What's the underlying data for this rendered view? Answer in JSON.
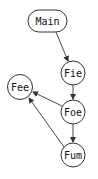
{
  "diagram": {
    "type": "directed-graph",
    "colors": {
      "stroke": "#333333",
      "text": "#111111",
      "background": "#ffffff"
    },
    "nodes": [
      {
        "id": "main",
        "label": "Main",
        "shape": "rounded-rect"
      },
      {
        "id": "fie",
        "label": "Fie",
        "shape": "circle"
      },
      {
        "id": "fee",
        "label": "Fee",
        "shape": "circle"
      },
      {
        "id": "foe",
        "label": "Foe",
        "shape": "circle"
      },
      {
        "id": "fum",
        "label": "Fum",
        "shape": "circle"
      }
    ],
    "edges": [
      {
        "from": "Main",
        "to": "Fie"
      },
      {
        "from": "Fie",
        "to": "Foe"
      },
      {
        "from": "Foe",
        "to": "Fee"
      },
      {
        "from": "Foe",
        "to": "Fum"
      },
      {
        "from": "Fum",
        "to": "Fee"
      }
    ]
  }
}
